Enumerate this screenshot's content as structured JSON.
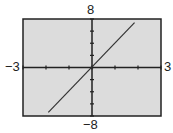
{
  "chart_data": {
    "type": "line",
    "title": "",
    "xlabel": "",
    "ylabel": "",
    "xlim": [
      -3,
      3
    ],
    "ylim": [
      -8,
      8
    ],
    "x_tick_step": 1,
    "y_tick_step": 2,
    "grid": false,
    "series": [
      {
        "name": "y = 4x",
        "x": [
          -1.9,
          1.85
        ],
        "y": [
          -7.4,
          7.4
        ]
      }
    ],
    "window_labels": {
      "xmin": "−3",
      "xmax": "3",
      "ymin": "−8",
      "ymax": "8"
    }
  },
  "colors": {
    "background": "#dcdcdc",
    "frame": "#222222",
    "line": "#333333"
  }
}
